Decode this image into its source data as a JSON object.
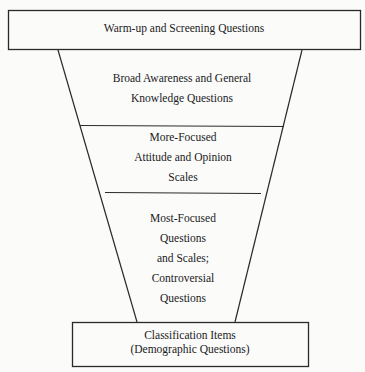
{
  "diagram": {
    "type": "funnel",
    "stages": [
      {
        "id": "top",
        "lines": [
          "Warm-up and Screening Questions"
        ]
      },
      {
        "id": "broad",
        "lines": [
          "Broad Awareness and General",
          "Knowledge Questions"
        ]
      },
      {
        "id": "more-focused",
        "lines": [
          "More-Focused",
          "Attitude and Opinion",
          "Scales"
        ]
      },
      {
        "id": "most-focused",
        "lines": [
          "Most-Focused",
          "Questions",
          "and Scales;",
          "Controversial",
          "Questions"
        ]
      },
      {
        "id": "bottom",
        "lines": [
          "Classification Items",
          "(Demographic Questions)"
        ]
      }
    ],
    "colors": {
      "line": "#2a2a2a",
      "background": "#fbfbfa",
      "text": "#1a1a1a"
    }
  }
}
